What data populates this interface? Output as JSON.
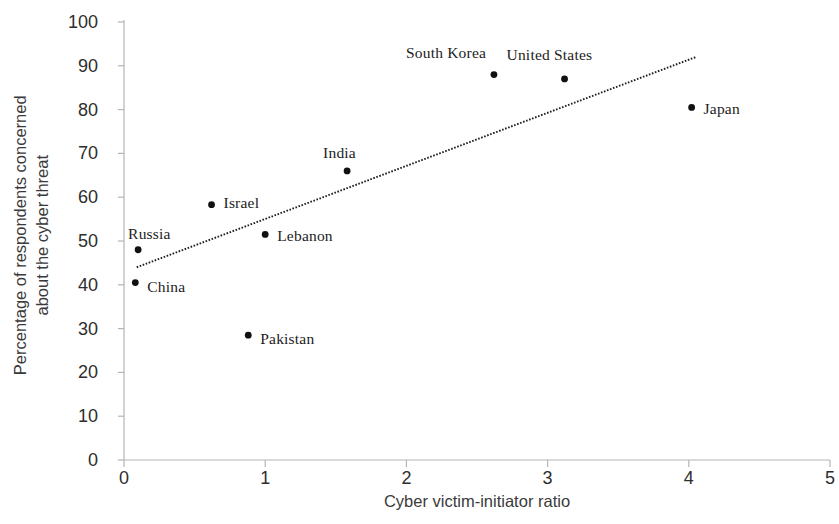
{
  "chart_data": {
    "type": "scatter",
    "title": "",
    "xlabel": "Cyber victim-initiator ratio",
    "ylabel": "Percentage of respondents concerned about the cyber threat",
    "ylabel_line1": "Percentage of respondents concerned",
    "ylabel_line2": "about the cyber threat",
    "xlim": [
      0,
      5
    ],
    "ylim": [
      0,
      100
    ],
    "xticks": [
      0,
      1,
      2,
      3,
      4,
      5
    ],
    "yticks": [
      0,
      10,
      20,
      30,
      40,
      50,
      60,
      70,
      80,
      90,
      100
    ],
    "xtick_labels": [
      "0",
      "1",
      "2",
      "3",
      "4",
      "5"
    ],
    "ytick_labels": [
      "0",
      "10",
      "20",
      "30",
      "40",
      "50",
      "60",
      "70",
      "80",
      "90",
      "100"
    ],
    "grid": false,
    "legend": "none",
    "marker_color": "#111111",
    "axis_color": "#b5b5b5",
    "trendline": {
      "style": "dotted",
      "color": "#1f1f1f",
      "x_start": 0.09,
      "y_start": 44.0,
      "x_end": 4.05,
      "y_end": 92.0
    },
    "points": [
      {
        "label": "China",
        "x": 0.08,
        "y": 40.5,
        "label_dx": 12,
        "label_dy": 4
      },
      {
        "label": "Russia",
        "x": 0.1,
        "y": 48.0,
        "label_dx": -10,
        "label_dy": -16
      },
      {
        "label": "Israel",
        "x": 0.62,
        "y": 58.3,
        "label_dx": 12,
        "label_dy": -2
      },
      {
        "label": "Pakistan",
        "x": 0.88,
        "y": 28.5,
        "label_dx": 12,
        "label_dy": 4
      },
      {
        "label": "Lebanon",
        "x": 1.0,
        "y": 51.5,
        "label_dx": 12,
        "label_dy": 2
      },
      {
        "label": "India",
        "x": 1.58,
        "y": 66.0,
        "label_dx": -24,
        "label_dy": -18
      },
      {
        "label": "South Korea",
        "x": 2.62,
        "y": 88.0,
        "label_dx": -88,
        "label_dy": -22
      },
      {
        "label": "United States",
        "x": 3.12,
        "y": 87.0,
        "label_dx": -58,
        "label_dy": -24
      },
      {
        "label": "Japan",
        "x": 4.02,
        "y": 80.5,
        "label_dx": 12,
        "label_dy": 2
      }
    ]
  }
}
